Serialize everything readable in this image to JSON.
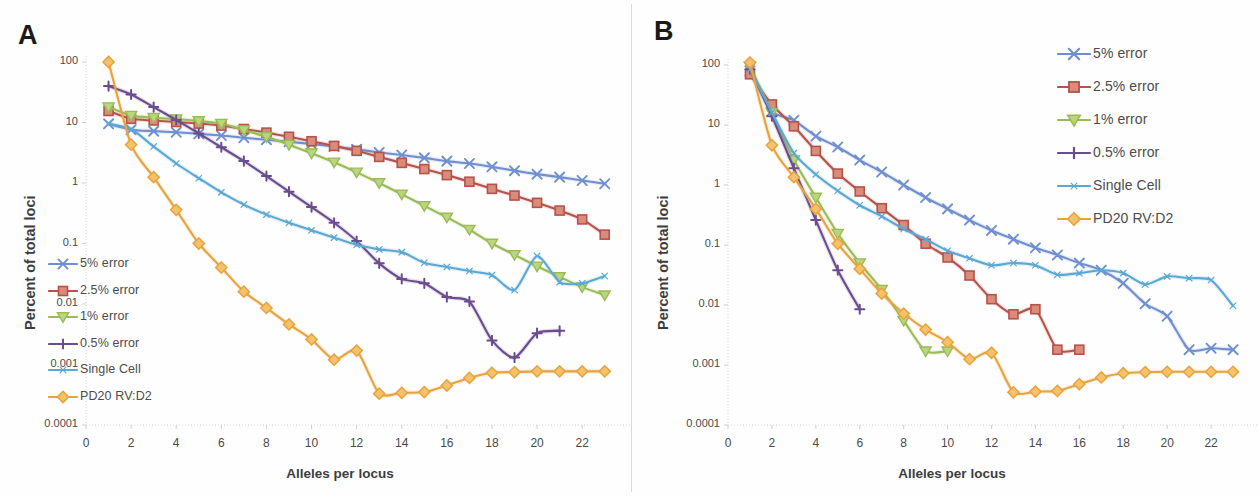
{
  "figure": {
    "panel_a_letter": "A",
    "panel_b_letter": "B"
  },
  "colors": {
    "error5": "#6f8fd0",
    "error25": "#b5534a",
    "error1": "#9bbb59",
    "error05": "#6a4d8f",
    "single_cell": "#5ba8d4",
    "pd20": "#e8a33d",
    "marker_error25_fill": "#d98c7a",
    "marker_error1_fill": "#b9d77a",
    "marker_pd20_fill": "#f5c26b",
    "axis": "#d0d0d0",
    "text": "#4a4a4a"
  },
  "legend_a": {
    "items": [
      {
        "label": "5% error",
        "color": "#6f8fd0",
        "marker": "x"
      },
      {
        "label": "2.5% error",
        "color": "#b5534a",
        "marker": "square"
      },
      {
        "label": "1% error",
        "color": "#9bbb59",
        "marker": "triangle"
      },
      {
        "label": "0.5% error",
        "color": "#6a4d8f",
        "marker": "plus"
      },
      {
        "label": "Single Cell",
        "color": "#5ba8d4",
        "marker": "line"
      },
      {
        "label": "PD20 RV:D2",
        "color": "#e8a33d",
        "marker": "diamond"
      }
    ]
  },
  "legend_b": {
    "items": [
      {
        "label": "5% error",
        "color": "#6f8fd0",
        "marker": "x"
      },
      {
        "label": "2.5% error",
        "color": "#b5534a",
        "marker": "square"
      },
      {
        "label": "1% error",
        "color": "#9bbb59",
        "marker": "triangle"
      },
      {
        "label": "0.5% error",
        "color": "#6a4d8f",
        "marker": "plus"
      },
      {
        "label": "Single Cell",
        "color": "#5ba8d4",
        "marker": "line"
      },
      {
        "label": "PD20 RV:D2",
        "color": "#e8a33d",
        "marker": "diamond"
      }
    ]
  },
  "chart_data": [
    {
      "panel": "A",
      "type": "line",
      "title": "",
      "xlabel": "Alleles per locus",
      "ylabel": "Percent of total loci",
      "yscale": "log",
      "xlim": [
        0,
        23.5
      ],
      "ylim": [
        0.0001,
        100
      ],
      "xticks": [
        0,
        2,
        4,
        6,
        8,
        10,
        12,
        14,
        16,
        18,
        20,
        22
      ],
      "yticks": [
        100,
        10,
        1,
        0.1,
        0.01,
        0.001,
        0.0001
      ],
      "ytick_labels": [
        "100",
        "10",
        "1",
        "0.1",
        "0.01",
        "0.001",
        "0.0001"
      ],
      "grid": false,
      "legend_position": "inside-lower-left",
      "series": [
        {
          "name": "5% error",
          "color": "#6f8fd0",
          "marker": "x",
          "x": [
            1,
            2,
            3,
            4,
            5,
            6,
            7,
            8,
            9,
            10,
            11,
            12,
            13,
            14,
            15,
            16,
            17,
            18,
            19,
            20,
            21,
            22,
            23
          ],
          "y": [
            9.5,
            7.6,
            7.2,
            6.9,
            6.5,
            6.1,
            5.6,
            5.2,
            4.8,
            4.4,
            4.0,
            3.6,
            3.2,
            2.9,
            2.6,
            2.3,
            2.1,
            1.85,
            1.6,
            1.4,
            1.25,
            1.1,
            0.97
          ]
        },
        {
          "name": "2.5% error",
          "color": "#b5534a",
          "marker": "square",
          "x": [
            1,
            2,
            3,
            4,
            5,
            6,
            7,
            8,
            9,
            10,
            11,
            12,
            13,
            14,
            15,
            16,
            17,
            18,
            19,
            20,
            21,
            22,
            23
          ],
          "y": [
            15.5,
            11.5,
            10.8,
            10.2,
            9.6,
            8.9,
            7.8,
            6.8,
            5.8,
            4.9,
            4.1,
            3.4,
            2.7,
            2.15,
            1.7,
            1.35,
            1.05,
            0.8,
            0.62,
            0.47,
            0.35,
            0.25,
            0.14
          ]
        },
        {
          "name": "1% error",
          "color": "#9bbb59",
          "marker": "triangle",
          "x": [
            1,
            2,
            3,
            4,
            5,
            6,
            7,
            8,
            9,
            10,
            11,
            12,
            13,
            14,
            15,
            16,
            17,
            18,
            19,
            20,
            21,
            22,
            23
          ],
          "y": [
            18.0,
            13.0,
            12.0,
            11.4,
            10.6,
            9.6,
            7.5,
            5.8,
            4.3,
            3.1,
            2.2,
            1.5,
            1.0,
            0.65,
            0.42,
            0.27,
            0.17,
            0.1,
            0.065,
            0.042,
            0.028,
            0.019,
            0.014
          ]
        },
        {
          "name": "0.5% error",
          "color": "#6a4d8f",
          "marker": "plus",
          "x": [
            1,
            2,
            3,
            4,
            5,
            6,
            7,
            8,
            9,
            10,
            11,
            12,
            13,
            14,
            15,
            16,
            17,
            18,
            19,
            20,
            21
          ],
          "y": [
            40.0,
            29.0,
            18.0,
            11.0,
            6.6,
            3.9,
            2.3,
            1.3,
            0.72,
            0.4,
            0.22,
            0.11,
            0.047,
            0.026,
            0.022,
            0.013,
            0.011,
            0.0025,
            0.0013,
            0.0033,
            0.0036
          ]
        },
        {
          "name": "Single Cell",
          "color": "#5ba8d4",
          "marker": "line",
          "x": [
            1,
            2,
            3,
            4,
            5,
            6,
            7,
            8,
            9,
            10,
            11,
            12,
            13,
            14,
            15,
            16,
            17,
            18,
            19,
            20,
            21,
            22,
            23
          ],
          "y": [
            9.5,
            7.8,
            4.0,
            2.1,
            1.2,
            0.7,
            0.44,
            0.3,
            0.22,
            0.165,
            0.125,
            0.095,
            0.08,
            0.072,
            0.048,
            0.041,
            0.035,
            0.03,
            0.017,
            0.062,
            0.023,
            0.022,
            0.029
          ]
        },
        {
          "name": "PD20 RV:D2",
          "color": "#e8a33d",
          "marker": "diamond",
          "x": [
            1,
            2,
            3,
            4,
            5,
            6,
            7,
            8,
            9,
            10,
            11,
            12,
            13,
            14,
            15,
            16,
            17,
            18,
            19,
            20,
            21,
            22,
            23
          ],
          "y": [
            100.0,
            4.3,
            1.25,
            0.36,
            0.1,
            0.04,
            0.016,
            0.0086,
            0.0046,
            0.0026,
            0.0012,
            0.0017,
            0.00033,
            0.00034,
            0.00035,
            0.00045,
            0.0006,
            0.00073,
            0.00075,
            0.00077,
            0.00077,
            0.00077,
            0.00077
          ]
        }
      ]
    },
    {
      "panel": "B",
      "type": "line",
      "title": "",
      "xlabel": "Alleles per locus",
      "ylabel": "Percent of total loci",
      "yscale": "log",
      "xlim": [
        0,
        23.5
      ],
      "ylim": [
        0.0001,
        100
      ],
      "xticks": [
        0,
        2,
        4,
        6,
        8,
        10,
        12,
        14,
        16,
        18,
        20,
        22
      ],
      "yticks": [
        100,
        10,
        1,
        0.1,
        0.01,
        0.001,
        0.0001
      ],
      "ytick_labels": [
        "100",
        "10",
        "1",
        "0.1",
        "0.01",
        "0.001",
        "0.0001"
      ],
      "grid": false,
      "legend_position": "outside-top-right",
      "series": [
        {
          "name": "5% error",
          "color": "#6f8fd0",
          "marker": "x",
          "x": [
            1,
            2,
            3,
            4,
            5,
            6,
            7,
            8,
            9,
            10,
            11,
            12,
            13,
            14,
            15,
            16,
            17,
            18,
            19,
            20,
            21,
            22,
            23
          ],
          "y": [
            80.0,
            17.0,
            12.0,
            6.5,
            4.3,
            2.6,
            1.65,
            1.0,
            0.62,
            0.4,
            0.26,
            0.175,
            0.125,
            0.09,
            0.068,
            0.05,
            0.038,
            0.023,
            0.0105,
            0.0065,
            0.0018,
            0.0019,
            0.0018
          ]
        },
        {
          "name": "2.5% error",
          "color": "#b5534a",
          "marker": "square",
          "x": [
            1,
            2,
            3,
            4,
            5,
            6,
            7,
            8,
            9,
            10,
            11,
            12,
            13,
            14,
            15,
            16
          ],
          "y": [
            70.0,
            22.0,
            9.5,
            3.7,
            1.55,
            0.78,
            0.41,
            0.215,
            0.105,
            0.062,
            0.031,
            0.0125,
            0.007,
            0.0085,
            0.0018,
            0.0018
          ]
        },
        {
          "name": "1% error",
          "color": "#9bbb59",
          "marker": "triangle",
          "x": [
            1,
            2,
            3,
            4,
            5,
            6,
            7,
            8,
            9,
            10
          ],
          "y": [
            95.0,
            16.0,
            2.6,
            0.62,
            0.155,
            0.05,
            0.018,
            0.0055,
            0.0017,
            0.0017
          ]
        },
        {
          "name": "0.5% error",
          "color": "#6a4d8f",
          "marker": "plus",
          "x": [
            1,
            2,
            3,
            4,
            5,
            6
          ],
          "y": [
            85.0,
            14.0,
            1.9,
            0.26,
            0.038,
            0.0085
          ]
        },
        {
          "name": "Single Cell",
          "color": "#5ba8d4",
          "marker": "line",
          "x": [
            1,
            2,
            3,
            4,
            5,
            6,
            7,
            8,
            9,
            10,
            11,
            12,
            13,
            14,
            15,
            16,
            17,
            18,
            19,
            20,
            21,
            22,
            23
          ],
          "y": [
            85.0,
            16.0,
            3.4,
            1.5,
            0.8,
            0.46,
            0.3,
            0.185,
            0.125,
            0.08,
            0.06,
            0.046,
            0.05,
            0.046,
            0.032,
            0.034,
            0.038,
            0.034,
            0.022,
            0.03,
            0.028,
            0.026,
            0.0097
          ]
        },
        {
          "name": "PD20 RV:D2",
          "color": "#e8a33d",
          "marker": "diamond",
          "x": [
            1,
            2,
            3,
            4,
            5,
            6,
            7,
            8,
            9,
            10,
            11,
            12,
            13,
            14,
            15,
            16,
            17,
            18,
            19,
            20,
            21,
            22,
            23
          ],
          "y": [
            110.0,
            4.6,
            1.35,
            0.4,
            0.105,
            0.04,
            0.0155,
            0.0072,
            0.0039,
            0.0024,
            0.00125,
            0.0016,
            0.00035,
            0.00036,
            0.00037,
            0.00048,
            0.00062,
            0.00073,
            0.00076,
            0.00077,
            0.00077,
            0.00077,
            0.00077
          ]
        }
      ]
    }
  ],
  "panel_a_axes": {
    "ylabel": "Percent of total loci",
    "xlabel": "Alleles per locus",
    "ytick_labels": [
      "100",
      "10",
      "1",
      "0.1",
      "0.01",
      "0.001",
      "0.0001"
    ],
    "xtick_labels": [
      "0",
      "2",
      "4",
      "6",
      "8",
      "10",
      "12",
      "14",
      "16",
      "18",
      "20",
      "22"
    ]
  },
  "panel_b_axes": {
    "ylabel": "Percent of total loci",
    "xlabel": "Alleles per locus",
    "ytick_labels": [
      "100",
      "10",
      "1",
      "0.1",
      "0.01",
      "0.001",
      "0.0001"
    ],
    "xtick_labels": [
      "0",
      "2",
      "4",
      "6",
      "8",
      "10",
      "12",
      "14",
      "16",
      "18",
      "20",
      "22"
    ]
  }
}
